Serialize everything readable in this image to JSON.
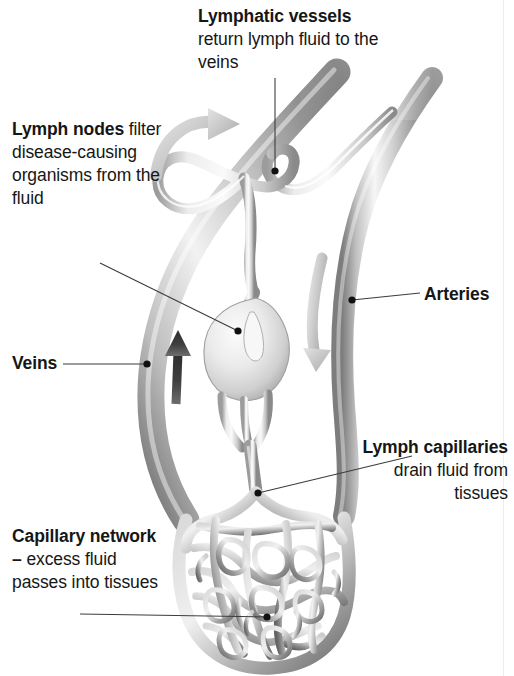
{
  "figure": {
    "background": "#ffffff",
    "width": 514,
    "height": 676
  },
  "labels": {
    "lymphatic_vessels": {
      "heading": "Lymphatic vessels",
      "body": "return lymph fluid to the veins"
    },
    "lymph_nodes": {
      "heading": "Lymph nodes",
      "body": "filter disease-causing organisms from the fluid"
    },
    "veins": {
      "heading": "Veins",
      "body": ""
    },
    "arteries": {
      "heading": "Arteries",
      "body": ""
    },
    "lymph_capillaries": {
      "heading": "Lymph capillaries",
      "body": "drain fluid from tissues"
    },
    "capillary_network": {
      "heading": "Capillary network –",
      "body": "excess fluid passes into tissues"
    }
  },
  "colors": {
    "text": "#161616",
    "leader_line": "#3c3c3c",
    "vessel_light": "#f2f2f2",
    "vessel_mid": "#b9b9b9",
    "vessel_dark": "#6f6f6f",
    "arrow_light": "#c9c9c9",
    "arrow_dark": "#4a4a4a",
    "edge_rule": "#ececed"
  },
  "leaders": [
    {
      "name": "leader-lymphatic-vessels",
      "from": [
        275,
        78
      ],
      "to": [
        275,
        171
      ]
    },
    {
      "name": "leader-lymph-nodes",
      "from": [
        100,
        263
      ],
      "to": [
        238,
        331
      ]
    },
    {
      "name": "leader-veins",
      "from": [
        63,
        364
      ],
      "to": [
        147,
        364
      ]
    },
    {
      "name": "leader-arteries",
      "from": [
        420,
        293
      ],
      "to": [
        352,
        300
      ]
    },
    {
      "name": "leader-lymph-capillaries",
      "from": [
        412,
        456
      ],
      "to": [
        258,
        493
      ]
    },
    {
      "name": "leader-capillary-network",
      "from": [
        80,
        614
      ],
      "to": [
        267,
        617
      ]
    }
  ],
  "flow_arrows": [
    {
      "name": "arrow-lymph-return",
      "direction": "curve-right-up",
      "shade": "light"
    },
    {
      "name": "arrow-venous-return",
      "direction": "up",
      "shade": "dark"
    },
    {
      "name": "arrow-arterial-flow",
      "direction": "down",
      "shade": "light"
    }
  ]
}
